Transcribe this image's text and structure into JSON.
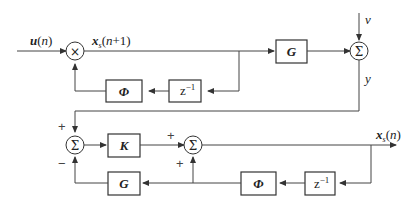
{
  "diagram": {
    "type": "block-diagram",
    "signals": {
      "input": "u(n)",
      "state_next": "xs(n+1)",
      "noise": "v",
      "output": "y",
      "estimate": "x̂s(n)"
    },
    "blocks": {
      "top_phi": "Φ",
      "top_delay": "z⁻¹",
      "top_g": "G",
      "gain_k": "K",
      "bottom_g": "G",
      "bottom_phi": "Φ",
      "bottom_delay": "z⁻¹"
    },
    "junctions": {
      "multiplier": "×",
      "sum_top": "Σ",
      "sum_left": "Σ",
      "sum_right": "Σ"
    },
    "signs": {
      "sum_left_top": "+",
      "sum_left_bottom": "−",
      "sum_right_left": "+",
      "sum_right_bottom": "+"
    }
  }
}
